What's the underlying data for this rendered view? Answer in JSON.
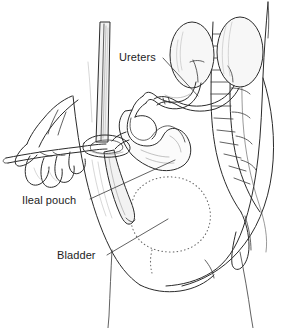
{
  "figure": {
    "background_color": "#ffffff",
    "ink_color": "#2b2b2b",
    "width": 292,
    "height": 328,
    "style": "line-art medical illustration"
  },
  "labels": [
    {
      "id": "ureters",
      "text": "Ureters",
      "x": 119,
      "y": 61,
      "leader": "M 163 58 L 198 96"
    },
    {
      "id": "ileal-pouch",
      "text": "Ileal pouch",
      "x": 22,
      "y": 204,
      "leader": "M 90 199 L 175 160"
    },
    {
      "id": "bladder",
      "text": "Bladder",
      "x": 57,
      "y": 259,
      "leader": "M 107 255 L 168 219"
    }
  ],
  "structures": [
    {
      "id": "kidney-left",
      "name": "Left kidney",
      "shape": "ellipse"
    },
    {
      "id": "kidney-right",
      "name": "Right kidney",
      "shape": "ellipse"
    },
    {
      "id": "vertebral-column",
      "name": "Vertebral column",
      "shape": "segmented-stack"
    },
    {
      "id": "ureter-tubes",
      "name": "Ureters",
      "shape": "paired-tubes"
    },
    {
      "id": "ileal-pouch-body",
      "name": "Ileal pouch",
      "shape": "lobed-reservoir"
    },
    {
      "id": "stoma",
      "name": "Abdominal stoma",
      "shape": "ring"
    },
    {
      "id": "catheter",
      "name": "Catheter",
      "shape": "long-tube"
    },
    {
      "id": "hand",
      "name": "Hand holding catheter",
      "shape": "outline"
    },
    {
      "id": "bladder-outline",
      "name": "Bladder",
      "shape": "dotted-outline"
    },
    {
      "id": "torso",
      "name": "Torso and thigh contour",
      "shape": "body-outline"
    }
  ]
}
